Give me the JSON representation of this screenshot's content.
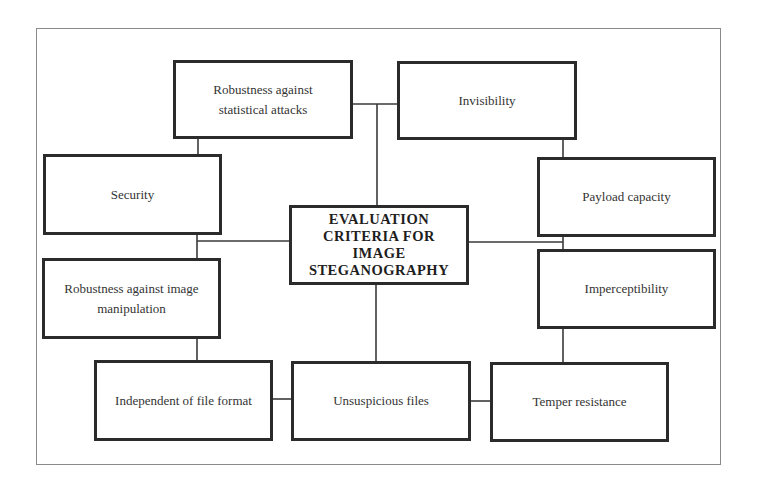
{
  "diagram": {
    "type": "hub-and-spoke criteria diagram",
    "center": {
      "label": "EVALUATION\nCRITERIA FOR\nIMAGE\nSTEGANOGRAPHY"
    },
    "nodes": [
      {
        "id": "robustness-statistical",
        "label": "Robustness against\nstatistical attacks"
      },
      {
        "id": "invisibility",
        "label": "Invisibility"
      },
      {
        "id": "security",
        "label": "Security"
      },
      {
        "id": "payload-capacity",
        "label": "Payload capacity"
      },
      {
        "id": "robustness-image-manipulation",
        "label": "Robustness against image\nmanipulation"
      },
      {
        "id": "imperceptibility",
        "label": "Imperceptibility"
      },
      {
        "id": "independent-file-format",
        "label": "Independent of file format"
      },
      {
        "id": "unsuspicious-files",
        "label": "Unsuspicious files"
      },
      {
        "id": "temper-resistance",
        "label": "Temper resistance"
      }
    ],
    "edges": [
      [
        "robustness-statistical",
        "invisibility"
      ],
      [
        "robustness-statistical",
        "security"
      ],
      [
        "security",
        "robustness-image-manipulation"
      ],
      [
        "robustness-image-manipulation",
        "independent-file-format"
      ],
      [
        "independent-file-format",
        "unsuspicious-files"
      ],
      [
        "unsuspicious-files",
        "temper-resistance"
      ],
      [
        "invisibility",
        "payload-capacity"
      ],
      [
        "payload-capacity",
        "imperceptibility"
      ],
      [
        "imperceptibility",
        "temper-resistance"
      ],
      [
        "center",
        "top-connector"
      ],
      [
        "center",
        "left-connector"
      ],
      [
        "center",
        "right-connector"
      ],
      [
        "center",
        "unsuspicious-files"
      ]
    ],
    "colors": {
      "box_border": "#2b2b2b",
      "line": "#3a3a3a",
      "frame": "#8a8a8a",
      "background": "#ffffff"
    }
  }
}
